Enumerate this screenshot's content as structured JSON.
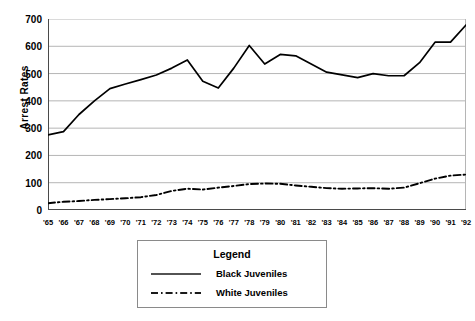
{
  "chart_data": {
    "type": "line",
    "title": "",
    "xlabel": "",
    "ylabel": "Arrest Rates",
    "ylim": [
      0,
      700
    ],
    "ytick_step": 100,
    "yticks": [
      0,
      100,
      200,
      300,
      400,
      500,
      600,
      700
    ],
    "grid": true,
    "legend_position": "below-plot",
    "legend_title": "Legend",
    "categories": [
      "'65",
      "'66",
      "'67",
      "'68",
      "'69",
      "'70",
      "'71",
      "'72",
      "'73",
      "'74",
      "'75",
      "'76",
      "'77",
      "'78",
      "'79",
      "'80",
      "'81",
      "'82",
      "'83",
      "'84",
      "'85",
      "'86",
      "'87",
      "'88",
      "'89",
      "'90",
      "'91",
      "'92"
    ],
    "series": [
      {
        "name": "Black Juveniles",
        "style": "solid",
        "color": "#000000",
        "values": [
          275,
          287,
          350,
          400,
          445,
          462,
          478,
          495,
          520,
          550,
          472,
          447,
          520,
          603,
          535,
          570,
          565,
          535,
          505,
          495,
          485,
          500,
          492,
          492,
          540,
          615,
          615,
          678
        ]
      },
      {
        "name": "White Juveniles",
        "style": "dash-dot",
        "color": "#000000",
        "values": [
          25,
          30,
          33,
          37,
          40,
          43,
          47,
          55,
          70,
          78,
          75,
          82,
          88,
          95,
          97,
          96,
          90,
          85,
          80,
          78,
          79,
          80,
          78,
          82,
          98,
          115,
          126,
          130
        ]
      }
    ]
  },
  "axes": {
    "y_title": "Arrest Rates",
    "y_tick_labels": [
      "700",
      "600",
      "500",
      "400",
      "300",
      "200",
      "100",
      "0"
    ],
    "x_tick_labels": [
      "'65",
      "'66",
      "'67",
      "'68",
      "'69",
      "'70",
      "'71",
      "'72",
      "'73",
      "'74",
      "'75",
      "'76",
      "'77",
      "'78",
      "'79",
      "'80",
      "'81",
      "'82",
      "'83",
      "'84",
      "'85",
      "'86",
      "'87",
      "'88",
      "'89",
      "'90",
      "'91",
      "'92"
    ]
  },
  "legend": {
    "title": "Legend",
    "entries": [
      {
        "label": "Black Juveniles",
        "style": "solid"
      },
      {
        "label": "White Juveniles",
        "style": "dash-dot"
      }
    ]
  },
  "colors": {
    "line": "#1a1a1a",
    "grid": "#b5b5b5",
    "axis": "#4a4a4a",
    "legend_border": "#8a8a8a",
    "background": "#ffffff"
  }
}
